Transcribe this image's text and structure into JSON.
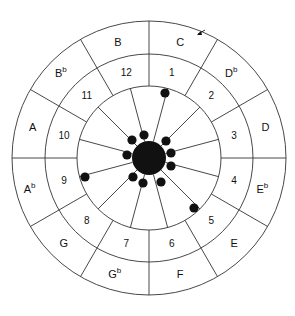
{
  "diagram": {
    "center": [
      149,
      158
    ],
    "radii": {
      "inner": 72,
      "middle": 104,
      "outer": 137
    },
    "hub_radius": 17,
    "ink_color": "#111111",
    "line_color": "#333333",
    "sectors": [
      {
        "number": "1",
        "note": "C",
        "accidental": ""
      },
      {
        "number": "2",
        "note": "D",
        "accidental": "b"
      },
      {
        "number": "3",
        "note": "D",
        "accidental": ""
      },
      {
        "number": "4",
        "note": "E",
        "accidental": "b"
      },
      {
        "number": "5",
        "note": "E",
        "accidental": ""
      },
      {
        "number": "6",
        "note": "F",
        "accidental": ""
      },
      {
        "number": "7",
        "note": "G",
        "accidental": "b"
      },
      {
        "number": "8",
        "note": "G",
        "accidental": ""
      },
      {
        "number": "9",
        "note": "A",
        "accidental": "b"
      },
      {
        "number": "10",
        "note": "A",
        "accidental": ""
      },
      {
        "number": "11",
        "note": "B",
        "accidental": "b"
      },
      {
        "number": "12",
        "note": "B",
        "accidental": ""
      }
    ],
    "hub_dots": [
      {
        "sector": 11,
        "x": 132,
        "y": 140
      },
      {
        "sector": 12,
        "x": 144,
        "y": 135
      },
      {
        "sector": 2,
        "x": 166,
        "y": 141
      },
      {
        "sector": 3,
        "x": 171,
        "y": 153
      },
      {
        "sector": 4,
        "x": 171,
        "y": 166
      },
      {
        "sector": 6,
        "x": 161,
        "y": 182
      },
      {
        "sector": 7,
        "x": 143,
        "y": 183
      },
      {
        "sector": 8,
        "x": 133,
        "y": 177
      },
      {
        "sector": 10,
        "x": 127,
        "y": 155
      }
    ],
    "rim_dots": [
      {
        "sector": 1,
        "x": 165,
        "y": 93
      },
      {
        "sector": 9,
        "x": 85,
        "y": 177
      },
      {
        "sector": 5,
        "x": 194,
        "y": 208
      }
    ],
    "arrow": {
      "x": 198,
      "y": 34,
      "direction": "down-left"
    }
  }
}
